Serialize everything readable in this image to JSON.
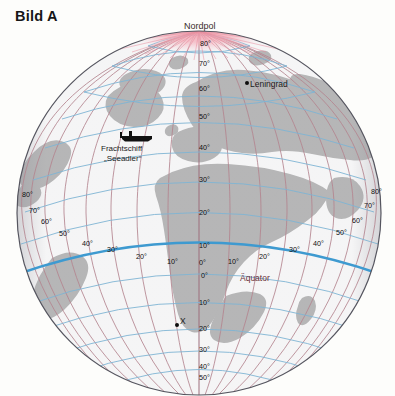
{
  "figure": {
    "title": "Bild A",
    "type": "globe-orthographic-map",
    "projection_center": {
      "lon": 0,
      "lat": 25
    },
    "background_color": "#fdfdfb"
  },
  "colors": {
    "land": "#b8b8b8",
    "ocean": "#ffffff",
    "parallel": "#7fb4d4",
    "meridian": "#b08a96",
    "equator": "#3e9ad0",
    "pole_glow": "#f2a7b4",
    "outline": "#4a4a55",
    "label": "#1b1b1b",
    "equator_label": "#6b3038"
  },
  "labels": {
    "nordpol": "Nordpol",
    "aequator": "Äquator",
    "leningrad": "Leningrad",
    "ship_line1": "Frachtschiff",
    "ship_line2": "„Seeadler“",
    "point_x": "X"
  },
  "markers": [
    {
      "name": "leningrad",
      "label": "Leningrad",
      "lat": 60,
      "lon": 30,
      "symbol": "dot"
    },
    {
      "name": "point-x",
      "label": "X",
      "lat": -20,
      "lon": -15,
      "symbol": "dot"
    },
    {
      "name": "ship-seeadler",
      "label": "Frachtschiff „Seeadler“",
      "lat": 45,
      "lon": -35,
      "symbol": "ship"
    }
  ],
  "graticule": {
    "spacing_degrees": 10,
    "latitude_labels_central": [
      "80°",
      "70°",
      "60°",
      "50°",
      "40°",
      "30°",
      "20°",
      "10°",
      "0°",
      "10°",
      "20°",
      "30°",
      "40°",
      "50°"
    ],
    "longitude_labels_west": [
      "80°",
      "70°",
      "60°",
      "50°",
      "40°",
      "30°",
      "20°",
      "10°",
      "0°"
    ],
    "longitude_labels_east": [
      "10°",
      "20°",
      "30°",
      "40°",
      "50°",
      "60°",
      "70°",
      "80°"
    ],
    "equator_highlighted": true
  },
  "chart_data": {
    "type": "map",
    "title": "Bild A",
    "projection": "orthographic",
    "graticule_interval_deg": 10,
    "annotations": [
      {
        "text": "Nordpol",
        "lat": 90,
        "lon": 0
      },
      {
        "text": "Äquator",
        "lat": 0,
        "lon": 20
      },
      {
        "text": "Leningrad",
        "lat": 60,
        "lon": 30
      },
      {
        "text": "Frachtschiff „Seeadler“",
        "lat": 45,
        "lon": -35
      },
      {
        "text": "X",
        "lat": -20,
        "lon": -15
      }
    ],
    "lat_ticks": [
      80,
      70,
      60,
      50,
      40,
      30,
      20,
      10,
      0,
      -10,
      -20,
      -30,
      -40,
      -50
    ],
    "lon_ticks": [
      -80,
      -70,
      -60,
      -50,
      -40,
      -30,
      -20,
      -10,
      0,
      10,
      20,
      30,
      40,
      50,
      60,
      70,
      80
    ]
  },
  "graticule_numbers": [
    {
      "id": "lat-n80",
      "text": "80°",
      "x": 200,
      "y": 39
    },
    {
      "id": "lat-n70",
      "text": "70°",
      "x": 199,
      "y": 59
    },
    {
      "id": "lat-n60",
      "text": "60°",
      "x": 199,
      "y": 84
    },
    {
      "id": "lat-n50",
      "text": "50°",
      "x": 199,
      "y": 112
    },
    {
      "id": "lat-n40",
      "text": "40°",
      "x": 199,
      "y": 143
    },
    {
      "id": "lat-n30",
      "text": "30°",
      "x": 199,
      "y": 175
    },
    {
      "id": "lat-n20",
      "text": "20°",
      "x": 199,
      "y": 208
    },
    {
      "id": "lat-n10",
      "text": "10°",
      "x": 199,
      "y": 241
    },
    {
      "id": "lat-00",
      "text": "0°",
      "x": 201,
      "y": 271
    },
    {
      "id": "lat-s10",
      "text": "10°",
      "x": 199,
      "y": 298
    },
    {
      "id": "lat-s20",
      "text": "20°",
      "x": 199,
      "y": 324
    },
    {
      "id": "lat-s30",
      "text": "30°",
      "x": 199,
      "y": 345
    },
    {
      "id": "lat-s40",
      "text": "40°",
      "x": 199,
      "y": 362
    },
    {
      "id": "lat-s50",
      "text": "50°",
      "x": 199,
      "y": 373
    },
    {
      "id": "lon-w80",
      "text": "80°",
      "x": 22,
      "y": 190
    },
    {
      "id": "lon-w70",
      "text": "70°",
      "x": 29,
      "y": 206
    },
    {
      "id": "lon-w60",
      "text": "60°",
      "x": 41,
      "y": 217
    },
    {
      "id": "lon-w50",
      "text": "50°",
      "x": 59,
      "y": 229
    },
    {
      "id": "lon-w40",
      "text": "40°",
      "x": 82,
      "y": 239
    },
    {
      "id": "lon-w30",
      "text": "30°",
      "x": 107,
      "y": 245
    },
    {
      "id": "lon-w20",
      "text": "20°",
      "x": 136,
      "y": 252
    },
    {
      "id": "lon-w10",
      "text": "10°",
      "x": 167,
      "y": 257
    },
    {
      "id": "lon-000",
      "text": "0°",
      "x": 199,
      "y": 258
    },
    {
      "id": "lon-e10",
      "text": "10°",
      "x": 228,
      "y": 257
    },
    {
      "id": "lon-e20",
      "text": "20°",
      "x": 259,
      "y": 252
    },
    {
      "id": "lon-e30",
      "text": "30°",
      "x": 289,
      "y": 245
    },
    {
      "id": "lon-e40",
      "text": "40°",
      "x": 313,
      "y": 239
    },
    {
      "id": "lon-e50",
      "text": "50°",
      "x": 336,
      "y": 228
    },
    {
      "id": "lon-e60",
      "text": "60°",
      "x": 352,
      "y": 216
    },
    {
      "id": "lon-e70",
      "text": "70°",
      "x": 364,
      "y": 201
    },
    {
      "id": "lon-e80",
      "text": "80°",
      "x": 371,
      "y": 187
    }
  ]
}
